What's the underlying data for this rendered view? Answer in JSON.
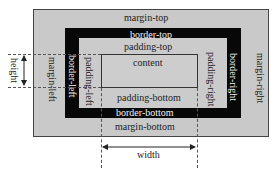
{
  "diagram": {
    "colors": {
      "margin": "#c9c9c9",
      "border": "#080808",
      "padding": "#cbcbcb",
      "content": "#cdcdcd",
      "outline": "#333333"
    },
    "labels": {
      "margin_top": "margin-top",
      "margin_bottom": "margin-bottom",
      "margin_left": "margin-left",
      "margin_right": "margin-right",
      "border_top": "border-top",
      "border_bottom": "border-bottom",
      "border_left": "border-left",
      "border_right": "border-right",
      "padding_top": "padding-top",
      "padding_bottom": "padding-bottom",
      "padding_left": "padding-left",
      "padding_right": "padding-right",
      "content": "content",
      "height": "height",
      "width": "width"
    }
  }
}
